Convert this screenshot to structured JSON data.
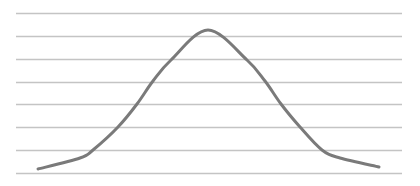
{
  "chart_data": {
    "type": "line",
    "title": "",
    "xlabel": "",
    "ylabel": "",
    "grid": true,
    "gridlines_count": 8,
    "legend": [],
    "series": [
      {
        "name": "bell-curve",
        "points": [
          {
            "x": 38,
            "y": 169
          },
          {
            "x": 80,
            "y": 158
          },
          {
            "x": 93,
            "y": 150
          },
          {
            "x": 118,
            "y": 127
          },
          {
            "x": 137,
            "y": 104
          },
          {
            "x": 153,
            "y": 81
          },
          {
            "x": 171,
            "y": 60
          },
          {
            "x": 208,
            "y": 30
          },
          {
            "x": 247,
            "y": 60
          },
          {
            "x": 265,
            "y": 81
          },
          {
            "x": 281,
            "y": 104
          },
          {
            "x": 300,
            "y": 127
          },
          {
            "x": 322,
            "y": 150
          },
          {
            "x": 340,
            "y": 158
          },
          {
            "x": 379,
            "y": 167
          }
        ]
      }
    ]
  },
  "colors": {
    "background": "#ffffff",
    "gridline": "#c4c4c4",
    "curve": "#7a7a7a"
  }
}
